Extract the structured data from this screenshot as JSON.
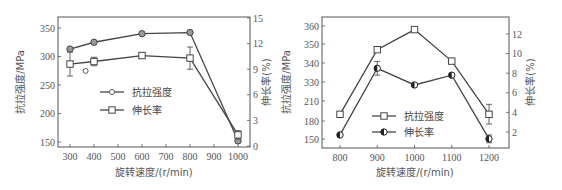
{
  "chart_data": [
    {
      "type": "line",
      "title": "",
      "xlabel": "旋转速度/(r/min)",
      "ylabel": "抗拉强度/MPa",
      "y2label": "伸长率(%)",
      "x_ticks": [
        "300",
        "400",
        "500",
        "600",
        "700",
        "800",
        "900",
        "1000"
      ],
      "y_ticks": [
        "150",
        "200",
        "250",
        "300",
        "350"
      ],
      "y2_ticks": [
        "0",
        "3",
        "6",
        "9",
        "12",
        "15"
      ],
      "xlim": [
        270,
        1050
      ],
      "ylim": [
        145,
        370
      ],
      "y2lim": [
        0,
        15
      ],
      "legend": [
        "抗拉强度",
        "伸长率"
      ],
      "series": [
        {
          "name": "抗拉强度",
          "axis": "left",
          "marker": "circle-filled",
          "x": [
            300,
            400,
            600,
            800,
            1000
          ],
          "values": [
            313,
            325,
            340,
            342,
            152
          ]
        },
        {
          "name": "伸长率",
          "axis": "right",
          "marker": "square-open",
          "x": [
            300,
            400,
            600,
            800,
            1000
          ],
          "values": [
            9.6,
            9.9,
            10.6,
            10.3,
            1.3
          ],
          "error": [
            1.4,
            0.5,
            0.2,
            1.3,
            0.5
          ]
        }
      ],
      "annotations": [
        {
          "type": "outlier-circle",
          "x": 365,
          "y2": 8.8
        }
      ]
    },
    {
      "type": "line",
      "title": "",
      "xlabel": "旋转速度/(r/min)",
      "ylabel": "抗拉强度/MPa",
      "y2label": "伸长率(%)",
      "x_ticks": [
        "800",
        "900",
        "1000",
        "1100",
        "1200"
      ],
      "y_ticks": [
        "150",
        "180",
        "210",
        "330",
        "340",
        "350",
        "360"
      ],
      "y2_ticks": [
        "2",
        "4",
        "6",
        "8",
        "10",
        "12"
      ],
      "legend": [
        "抗拉强度",
        "伸长率"
      ],
      "series": [
        {
          "name": "抗拉强度",
          "axis": "left",
          "marker": "square-open",
          "x": [
            800,
            900,
            1000,
            1100,
            1200
          ],
          "values": [
            190,
            347,
            358,
            341,
            190
          ],
          "error": [
            0,
            0,
            0,
            0,
            15
          ]
        },
        {
          "name": "伸长率",
          "axis": "right",
          "marker": "circle-half",
          "x": [
            800,
            900,
            1000,
            1100,
            1200
          ],
          "values": [
            1.7,
            8.5,
            6.8,
            7.8,
            1.3
          ],
          "error": [
            0,
            0.7,
            0,
            0,
            0.4
          ]
        }
      ]
    }
  ]
}
